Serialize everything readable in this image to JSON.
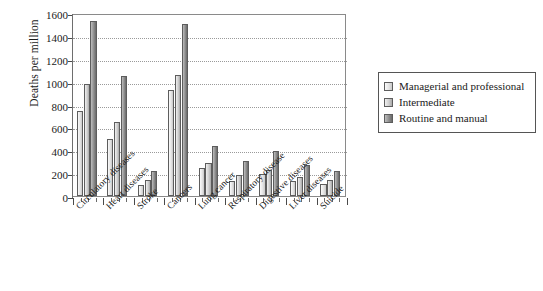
{
  "chart_data": {
    "type": "bar",
    "title": "",
    "xlabel": "",
    "ylabel": "Deaths per million",
    "ylim": [
      0,
      1600
    ],
    "ytick_labels": [
      "1600",
      "1400",
      "1200",
      "1000",
      "800",
      "600",
      "400",
      "200",
      "0"
    ],
    "ytick_values": [
      1600,
      1400,
      1200,
      1000,
      800,
      600,
      400,
      200,
      0
    ],
    "grid": "horizontal-dotted",
    "legend_position": "right",
    "categories": [
      "Circulatory diseases",
      "Heart diseases",
      "Stroke",
      "Cancers",
      "Lung cancer",
      "Respiratory disease",
      "Digestive diseases",
      "Liver diseases",
      "Suicide"
    ],
    "series": [
      {
        "name": "Managerial and professional",
        "color": "#e4e4e4",
        "values": [
          740,
          495,
          100,
          925,
          245,
          130,
          195,
          130,
          105
        ]
      },
      {
        "name": "Intermediate",
        "color": "#cfcfcf",
        "values": [
          975,
          650,
          140,
          1060,
          290,
          180,
          230,
          170,
          140
        ]
      },
      {
        "name": "Routine and manual",
        "color": "#8f8f8f",
        "values": [
          1530,
          1050,
          215,
          1500,
          435,
          305,
          390,
          270,
          215
        ]
      }
    ]
  },
  "legend": {
    "items": [
      {
        "label": "Managerial and professional"
      },
      {
        "label": "Intermediate"
      },
      {
        "label": "Routine and manual"
      }
    ]
  }
}
